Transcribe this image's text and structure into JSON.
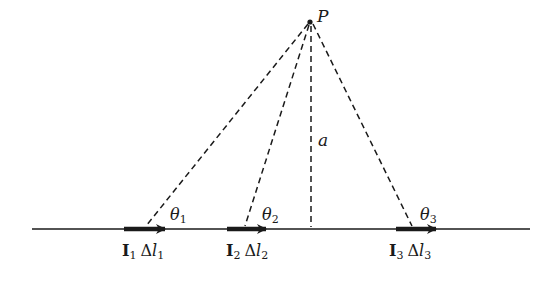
{
  "diagram": {
    "point_label": "P",
    "distance_label": "a",
    "angles": [
      {
        "symbol": "θ",
        "sub": "1"
      },
      {
        "symbol": "θ",
        "sub": "2"
      },
      {
        "symbol": "θ",
        "sub": "3"
      }
    ],
    "elements": [
      {
        "current": "I",
        "current_sub": "1",
        "delta": "Δ",
        "length": "l",
        "length_sub": "1"
      },
      {
        "current": "I",
        "current_sub": "2",
        "delta": "Δ",
        "length": "l",
        "length_sub": "2"
      },
      {
        "current": "I",
        "current_sub": "3",
        "delta": "Δ",
        "length": "l",
        "length_sub": "3"
      }
    ],
    "colors": {
      "ink": "#1a1a1a",
      "background": "#ffffff"
    }
  }
}
